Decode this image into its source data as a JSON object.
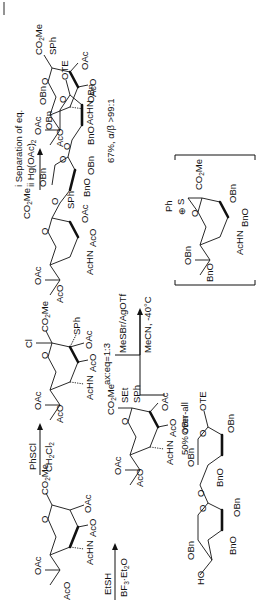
{
  "scheme": {
    "compounds": {
      "glycal": {
        "labels": [
          "OAc",
          "AcO",
          "AcHN",
          "AcO",
          "OAc",
          "O",
          "CO2Me"
        ]
      },
      "chloride": {
        "labels": [
          "OAc",
          "AcO",
          "AcHN",
          "AcO",
          "OAc",
          "O",
          "Cl",
          "CO2Me",
          "SPh"
        ],
        "ratio": "ax:eq=1:3"
      },
      "donor_top": {
        "labels": [
          "OAc",
          "AcO",
          "AcHN",
          "AcO",
          "OAc",
          "O",
          "CO2Me",
          "SPh"
        ]
      },
      "donor_bottom": {
        "labels": [
          "OAc",
          "AcO",
          "AcHN",
          "AcO",
          "OAc",
          "O",
          "CO2Me",
          "SEt",
          "SPh"
        ],
        "yield": "50% over-all"
      },
      "acceptor": {
        "labels": [
          "HO",
          "OBn",
          "O",
          "BnO",
          "OBn",
          "O",
          "BnO",
          "OBn",
          "O",
          "OBn",
          "OTE",
          "OBn"
        ]
      },
      "product": {
        "labels": [
          "OAc",
          "AcO",
          "AcHN",
          "AcO",
          "OAc",
          "O",
          "CO2Me",
          "O",
          "SPh",
          "OBn",
          "O",
          "BnO",
          "OBn",
          "O",
          "BnO",
          "OBn",
          "O",
          "OBn",
          "OTE",
          "OBn"
        ],
        "yield": "67%, α/β >99:1"
      },
      "intermediate": {
        "labels": [
          "OBn",
          "BnO",
          "AcHN",
          "BnO",
          "OBn",
          "O",
          "Ph",
          "S",
          "⊕",
          "CO2Me"
        ]
      }
    },
    "arrows": [
      {
        "id": "step1",
        "reagent_top": "EtSH",
        "reagent_bottom": "BF3·Et2O"
      },
      {
        "id": "step2",
        "reagent_top": "PhSCl",
        "reagent_bottom": "CH2Cl2"
      },
      {
        "id": "step3",
        "reagent_top": "i  Separation of eq.",
        "reagent_bottom": "ii Hg(OAc)2"
      },
      {
        "id": "step4",
        "reagent_top": "MeSBr/AgOTf",
        "reagent_bottom": "MeCN, -40°C"
      }
    ]
  }
}
